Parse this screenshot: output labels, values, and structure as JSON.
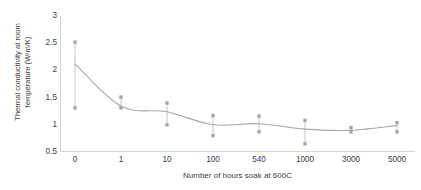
{
  "chart_data": {
    "type": "scatter",
    "title": "",
    "xlabel": "Number of hours soak at 600C",
    "ylabel": "Thermal conductivity at room temperature (W/m/K)",
    "ylabel_line1": "Thermal conductivity at room",
    "ylabel_line2": "temperature (W/m/K)",
    "categories": [
      "0",
      "1",
      "10",
      "100",
      "540",
      "1000",
      "3000",
      "5000"
    ],
    "x_tick_labels": [
      "0",
      "1",
      "10",
      "100",
      "540",
      "1000",
      "3000",
      "5000"
    ],
    "y_tick_labels": [
      "3",
      "2.5",
      "2",
      "1.5",
      "1",
      "0.5"
    ],
    "y_tick_values": [
      3,
      2.5,
      2,
      1.5,
      1,
      0.5
    ],
    "ylim": [
      0.5,
      3
    ],
    "grid": false,
    "legend": "none",
    "series": [
      {
        "name": "Mean thermal conductivity",
        "type": "line",
        "values": [
          2.12,
          1.34,
          1.24,
          1.0,
          1.02,
          0.92,
          0.9,
          0.99
        ]
      },
      {
        "name": "Measured maximum",
        "type": "scatter",
        "values": [
          2.52,
          1.51,
          1.4,
          1.17,
          1.16,
          1.08,
          0.95,
          1.04
        ]
      },
      {
        "name": "Measured minimum",
        "type": "scatter",
        "values": [
          1.31,
          1.31,
          1.0,
          0.8,
          0.87,
          0.65,
          0.87,
          0.87
        ]
      }
    ],
    "error_bars": {
      "present": true,
      "description": "vertical whisker from minimum to maximum at each category"
    },
    "colors": {
      "line": "#a6a6a6",
      "marker": "#a6a6a6",
      "error_bar": "#bfbfbf",
      "axis": "#d4d4d4",
      "text": "#3d3d3d",
      "background": "#ffffff"
    }
  }
}
